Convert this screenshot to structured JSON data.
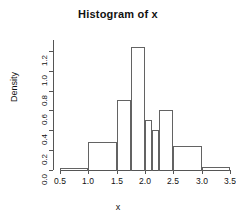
{
  "chart_data": {
    "type": "bar",
    "title": "Histogram of x",
    "xlabel": "x",
    "ylabel": "Density",
    "grid": false,
    "legend": false,
    "xlim": [
      0.5,
      3.5
    ],
    "ylim": [
      0.0,
      1.3
    ],
    "xticks": [
      "0.5",
      "1.0",
      "1.5",
      "2.0",
      "2.5",
      "3.0",
      "3.5"
    ],
    "xtick_values": [
      0.5,
      1.0,
      1.5,
      2.0,
      2.5,
      3.0,
      3.5
    ],
    "yticks": [
      "0.0",
      "0.2",
      "0.4",
      "0.6",
      "0.8",
      "1.0",
      "1.2"
    ],
    "ytick_values": [
      0.0,
      0.2,
      0.4,
      0.6,
      0.8,
      1.0,
      1.2
    ],
    "bin_edges": [
      0.5,
      1.0,
      1.5,
      1.75,
      2.0,
      2.125,
      2.25,
      2.5,
      3.0,
      3.5
    ],
    "bins": [
      {
        "left": 0.5,
        "right": 1.0,
        "density": 0.02
      },
      {
        "left": 1.0,
        "right": 1.5,
        "density": 0.28
      },
      {
        "left": 1.5,
        "right": 1.75,
        "density": 0.71
      },
      {
        "left": 1.75,
        "right": 2.0,
        "density": 1.24
      },
      {
        "left": 2.0,
        "right": 2.125,
        "density": 0.5
      },
      {
        "left": 2.125,
        "right": 2.25,
        "density": 0.4
      },
      {
        "left": 2.25,
        "right": 2.5,
        "density": 0.6
      },
      {
        "left": 2.5,
        "right": 3.0,
        "density": 0.24
      },
      {
        "left": 3.0,
        "right": 3.5,
        "density": 0.03
      }
    ],
    "categories": [
      "0.5-1.0",
      "1.0-1.5",
      "1.5-1.75",
      "1.75-2.0",
      "2.0-2.125",
      "2.125-2.25",
      "2.25-2.5",
      "2.5-3.0",
      "3.0-3.5"
    ],
    "values": [
      0.02,
      0.28,
      0.71,
      1.24,
      0.5,
      0.4,
      0.6,
      0.24,
      0.03
    ],
    "colors": {
      "bar_outline": "#636363",
      "axis": "#555555",
      "text": "#111111",
      "background": "#ffffff"
    }
  }
}
